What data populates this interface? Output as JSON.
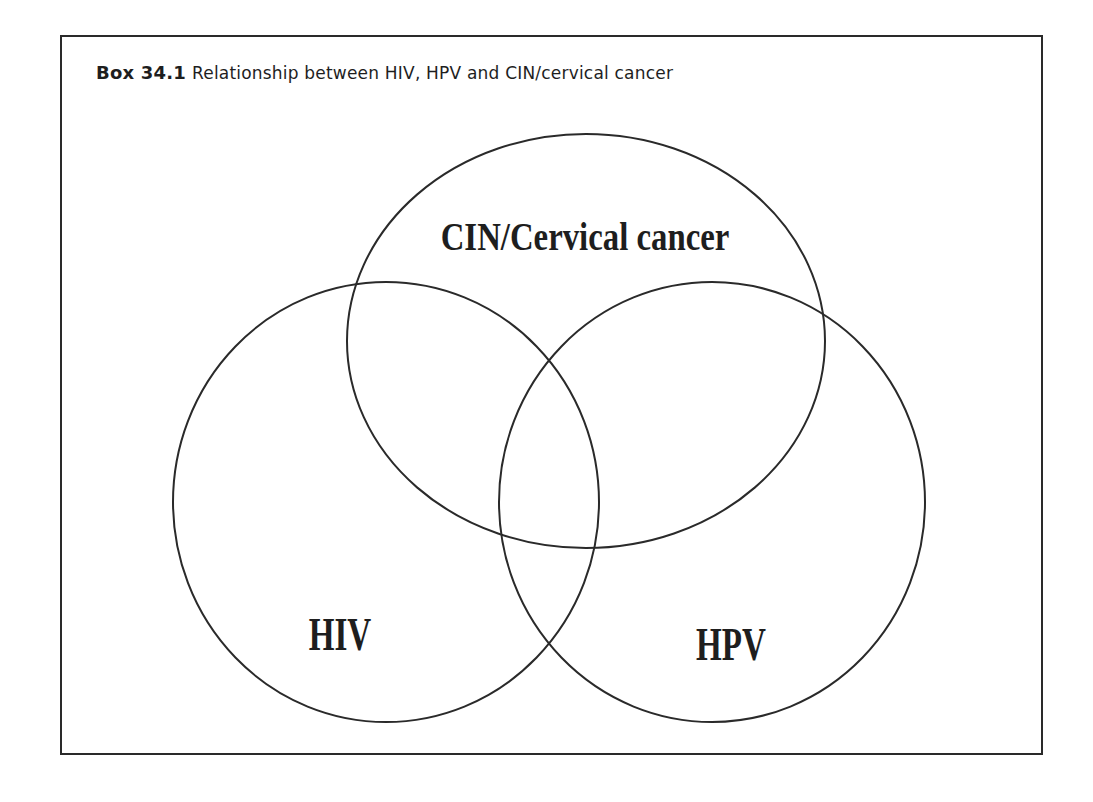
{
  "box": {
    "number": "Box 34.1",
    "caption": "Relationship between HIV, HPV and CIN/cervical cancer"
  },
  "diagram": {
    "type": "venn",
    "stroke_color": "#2a2a2a",
    "sets": [
      {
        "id": "cin",
        "label": "CIN/Cervical cancer",
        "cx": 586,
        "cy": 341,
        "rx": 239,
        "ry": 207
      },
      {
        "id": "hiv",
        "label": "HIV",
        "cx": 386,
        "cy": 502,
        "rx": 213,
        "ry": 220
      },
      {
        "id": "hpv",
        "label": "HPV",
        "cx": 712,
        "cy": 502,
        "rx": 213,
        "ry": 220
      }
    ]
  }
}
